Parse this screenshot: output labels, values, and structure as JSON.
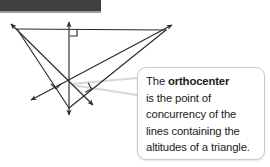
{
  "page": {
    "width": 270,
    "height": 167,
    "background": "#ffffff"
  },
  "top_bar": {
    "name": "page-header-bar",
    "color": "#3f3f42",
    "shadow_color": "#9a9a9c"
  },
  "callout": {
    "border_color": "#c9c9c9",
    "background": "#ffffff",
    "leader_color": "#d8d8d8",
    "lines": [
      {
        "prefix": "The ",
        "bold": "orthocenter",
        "suffix": ""
      },
      {
        "prefix": "is the point of",
        "bold": "",
        "suffix": ""
      },
      {
        "prefix": "concurrency of the",
        "bold": "",
        "suffix": ""
      },
      {
        "prefix": "lines containing the",
        "bold": "",
        "suffix": ""
      },
      {
        "prefix": "altitudes of a triangle.",
        "bold": "",
        "suffix": ""
      }
    ],
    "full_text": "The orthocenter is the point of concurrency of the lines containing the altitudes of a triangle."
  },
  "diagram": {
    "type": "geometry-construction",
    "stroke_color": "#2b2b2b",
    "stroke_width": 1.15,
    "triangle": {
      "label": "obtuse-triangle",
      "vertices": [
        {
          "name": "vertex-top-left",
          "x": 17,
          "y": 29
        },
        {
          "name": "vertex-top-right",
          "x": 166,
          "y": 30
        },
        {
          "name": "vertex-bottom",
          "x": 69,
          "y": 108
        }
      ]
    },
    "orthocenter": {
      "name": "orthocenter-point",
      "x": 69,
      "y": 83
    },
    "altitudes": [
      {
        "name": "altitude-vertical",
        "from": {
          "x": 69,
          "y": 22
        },
        "to": {
          "x": 69,
          "y": 115
        },
        "arrows": "both"
      },
      {
        "name": "altitude-from-top-left",
        "from": {
          "x": 11,
          "y": 24
        },
        "to": {
          "x": 93,
          "y": 105
        },
        "arrows": "both"
      },
      {
        "name": "altitude-from-top-right",
        "from": {
          "x": 172,
          "y": 25
        },
        "to": {
          "x": 31,
          "y": 100
        },
        "arrows": "both"
      }
    ],
    "right_angle_marks": [
      {
        "name": "right-angle-mark-top",
        "x": 70,
        "y": 29,
        "rotation": 0
      },
      {
        "name": "right-angle-mark-left",
        "x": 56,
        "y": 79,
        "rotation": 44
      },
      {
        "name": "right-angle-mark-right",
        "x": 82,
        "y": 86,
        "rotation": -28
      }
    ],
    "leader_lines": [
      {
        "name": "callout-leader-upper",
        "from": {
          "x": 137,
          "y": 78
        },
        "to": {
          "x": 71,
          "y": 84
        }
      },
      {
        "name": "callout-leader-lower",
        "from": {
          "x": 137,
          "y": 95
        },
        "to": {
          "x": 72,
          "y": 85
        }
      }
    ]
  }
}
